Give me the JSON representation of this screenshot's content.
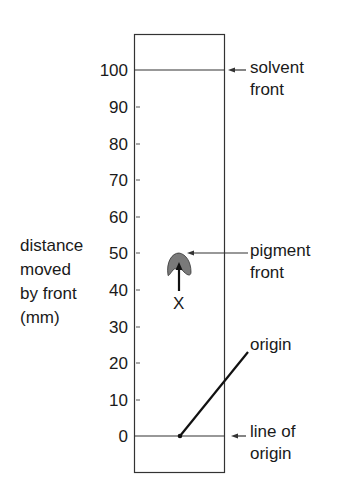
{
  "diagram": {
    "type": "chromatography-strip",
    "axis": {
      "title_lines": [
        "distance",
        "moved",
        "by front",
        "(mm)"
      ],
      "ticks": [
        "100",
        "90",
        "80",
        "70",
        "60",
        "50",
        "40",
        "30",
        "20",
        "10",
        "0"
      ],
      "unit": "mm",
      "range": [
        0,
        100
      ]
    },
    "labels": {
      "solvent_front": [
        "solvent",
        "front"
      ],
      "pigment_front": [
        "pigment",
        "front"
      ],
      "origin": "origin",
      "line_of_origin": [
        "line of",
        "origin"
      ],
      "x_marker": "X"
    },
    "values": {
      "solvent_front_mm": 100,
      "pigment_front_mm": 50,
      "origin_mm": 0
    },
    "colors": {
      "line": "#333333",
      "pigment_fill": "#7a7a7a",
      "text": "#1a1a1a"
    }
  }
}
